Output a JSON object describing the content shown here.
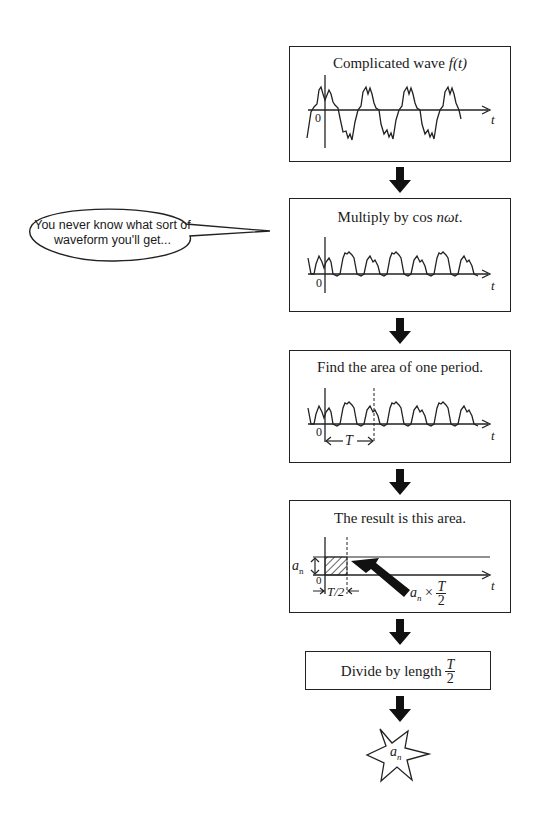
{
  "speech_bubble": {
    "line1": "You never know what sort of",
    "line2": "waveform you'll get..."
  },
  "steps": [
    {
      "title_prefix": "Complicated wave ",
      "title_math": "f(t)",
      "origin_label": "0",
      "axis_label": "t"
    },
    {
      "title_prefix": "Multiply by cos ",
      "title_math": "nωt",
      "title_suffix": ".",
      "origin_label": "0",
      "axis_label": "t"
    },
    {
      "title": "Find the area of one period.",
      "origin_label": "0",
      "axis_label": "t",
      "period_label": "T"
    },
    {
      "title": "The result is this area.",
      "origin_label": "0",
      "axis_label": "t",
      "height_label": "a",
      "height_sub": "n",
      "width_label": "T/2",
      "area_label_prefix": "a",
      "area_label_sub": "n",
      "area_label_times": "×",
      "area_frac_num": "T",
      "area_frac_den": "2"
    },
    {
      "title_prefix": "Divide by length ",
      "frac_num": "T",
      "frac_den": "2"
    }
  ],
  "result": {
    "symbol": "a",
    "sub": "n"
  },
  "colors": {
    "ink": "#222222",
    "background": "#ffffff"
  }
}
